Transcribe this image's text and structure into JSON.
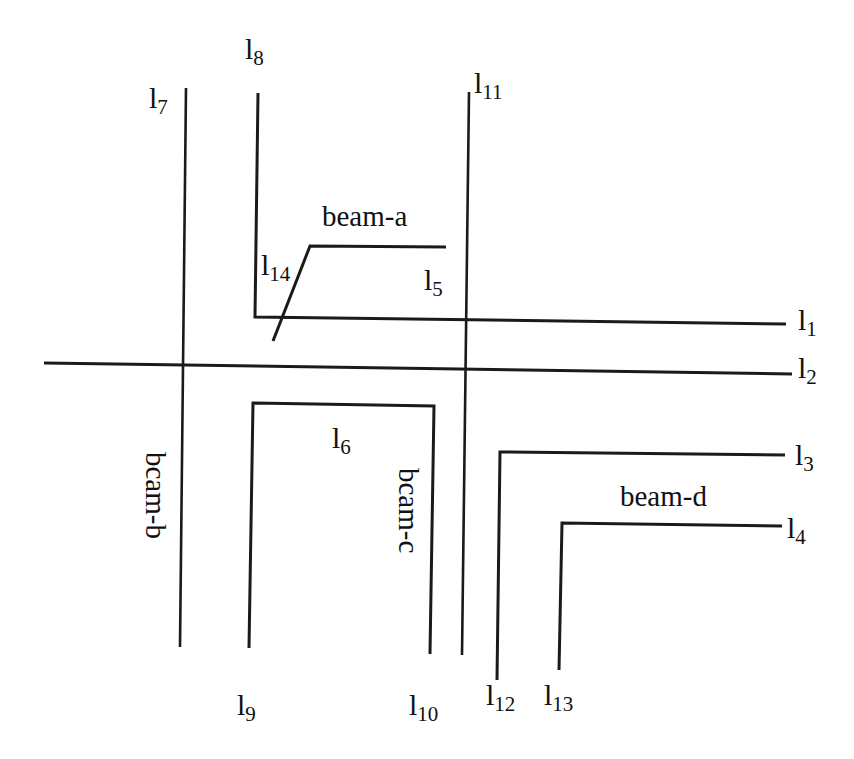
{
  "diagram": {
    "stroke_color": "#1a1a1a",
    "background": "#ffffff",
    "lines": [
      {
        "id": "l1",
        "base": "l",
        "sub": "1"
      },
      {
        "id": "l2",
        "base": "l",
        "sub": "2"
      },
      {
        "id": "l3",
        "base": "l",
        "sub": "3"
      },
      {
        "id": "l4",
        "base": "l",
        "sub": "4"
      },
      {
        "id": "l5",
        "base": "l",
        "sub": "5"
      },
      {
        "id": "l6",
        "base": "l",
        "sub": "6"
      },
      {
        "id": "l7",
        "base": "l",
        "sub": "7"
      },
      {
        "id": "l8",
        "base": "l",
        "sub": "8"
      },
      {
        "id": "l9",
        "base": "l",
        "sub": "9"
      },
      {
        "id": "l10",
        "base": "l",
        "sub": "10"
      },
      {
        "id": "l11",
        "base": "l",
        "sub": "11"
      },
      {
        "id": "l12",
        "base": "l",
        "sub": "12"
      },
      {
        "id": "l13",
        "base": "l",
        "sub": "13"
      },
      {
        "id": "l14",
        "base": "l",
        "sub": "14"
      }
    ],
    "beams": {
      "a": "beam-a",
      "b": "bcam-b",
      "c": "bcam-c",
      "d": "beam-d"
    }
  }
}
